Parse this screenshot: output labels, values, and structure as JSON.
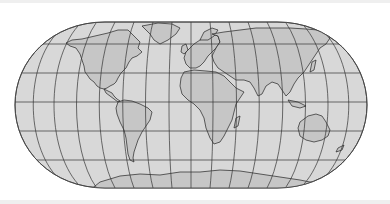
{
  "map": {
    "projection": "robinson-like world map",
    "colors": {
      "background": "#ffffff",
      "ocean": "#d8d8d8",
      "land": "#c6c6c6",
      "outline": "#222222",
      "grid": "#333333",
      "strip": "#efefef"
    },
    "graticule": {
      "parallels_deg": [
        -60,
        -30,
        0,
        30,
        60
      ],
      "meridian_spacing_deg": 20
    },
    "continents": [
      "north-america",
      "south-america",
      "europe",
      "africa",
      "asia",
      "australia",
      "antarctica",
      "greenland",
      "new-zealand"
    ]
  }
}
